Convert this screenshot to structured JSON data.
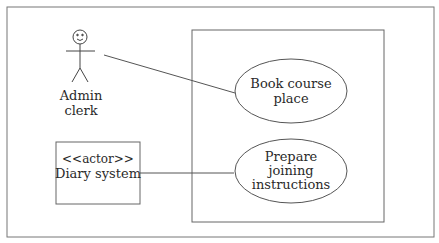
{
  "diagram": {
    "type": "uml-use-case",
    "actors": [
      {
        "id": "admin",
        "kind": "stick-figure",
        "label_lines": [
          "Admin",
          "clerk"
        ]
      },
      {
        "id": "diary",
        "kind": "box",
        "stereotype": "<<actor>>",
        "label": "Diary system"
      }
    ],
    "use_cases": [
      {
        "id": "book",
        "label_lines": [
          "Book course",
          "place"
        ]
      },
      {
        "id": "prepare",
        "label_lines": [
          "Prepare",
          "joining",
          "instructions"
        ]
      }
    ],
    "associations": [
      {
        "from": "admin",
        "to": "book"
      },
      {
        "from": "diary",
        "to": "prepare"
      }
    ],
    "colors": {
      "line": "#555555",
      "text": "#2a2a2a",
      "background": "#ffffff"
    }
  }
}
